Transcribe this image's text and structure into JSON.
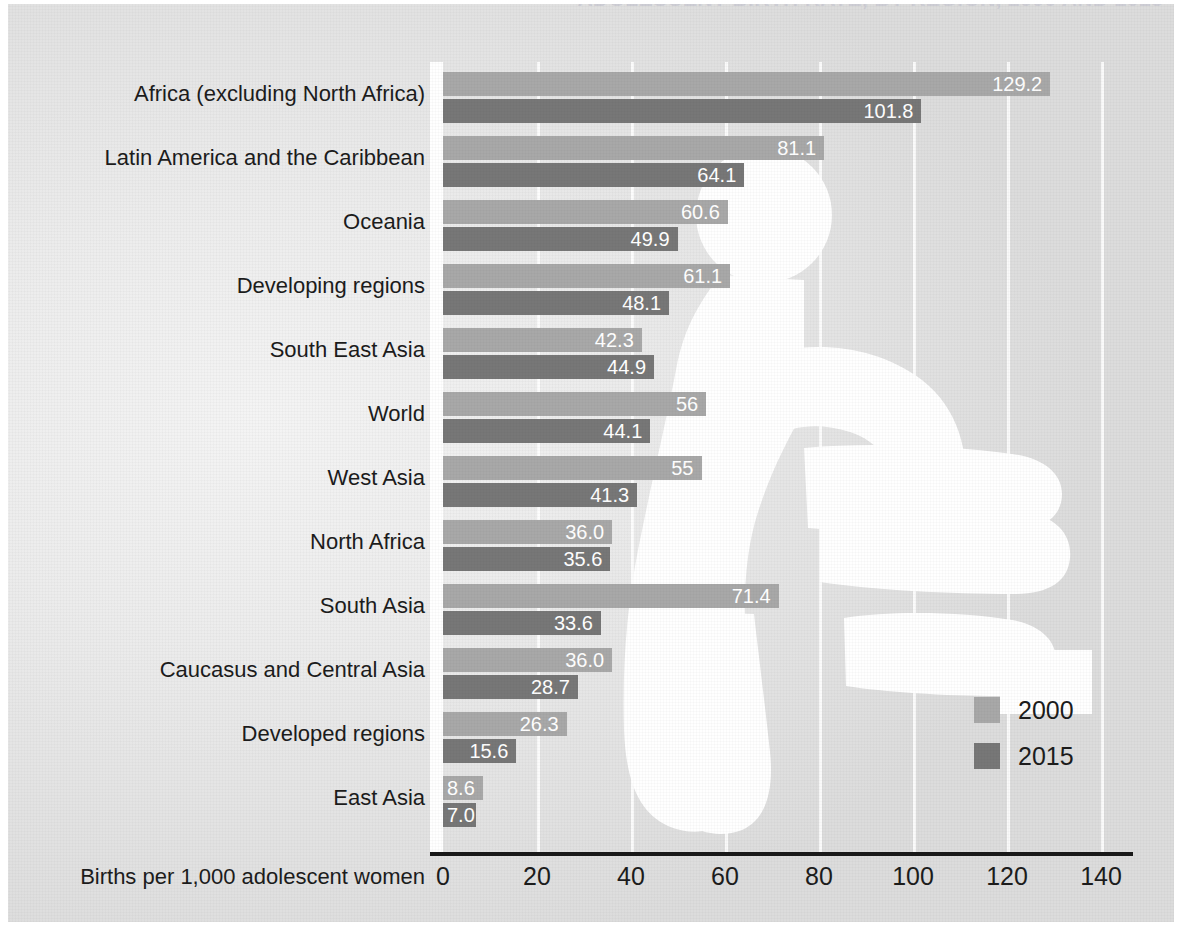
{
  "title": "ADOLESCENT BIRTH RATE, BY REGION, 2000 AND 2015",
  "legend": {
    "items": [
      {
        "label": "2000",
        "color": "#a8a8a8"
      },
      {
        "label": "2015",
        "color": "#777777"
      }
    ]
  },
  "axis": {
    "ylabel": "Births per 1,000 adolescent women",
    "xticks": [
      "0",
      "20",
      "40",
      "60",
      "80",
      "100",
      "120",
      "140"
    ]
  },
  "chart_data": {
    "type": "bar",
    "orientation": "horizontal",
    "title": "ADOLESCENT BIRTH RATE, BY REGION, 2000 AND 2015",
    "xlabel": "Births per 1,000 adolescent women",
    "ylabel": "",
    "xlim": [
      0,
      140
    ],
    "xticks": [
      0,
      20,
      40,
      60,
      80,
      100,
      120,
      140
    ],
    "grid": true,
    "legend_position": "bottom-right",
    "categories": [
      "Africa (excluding North Africa)",
      "Latin America and the Caribbean",
      "Oceania",
      "Developing regions",
      "South East Asia",
      "World",
      "West Asia",
      "North Africa",
      "South Asia",
      "Caucasus and Central Asia",
      "Developed regions",
      "East Asia"
    ],
    "series": [
      {
        "name": "2000",
        "color": "#a8a8a8",
        "values": [
          129.2,
          81.1,
          60.6,
          61.1,
          42.3,
          56,
          55,
          36.0,
          71.4,
          36.0,
          26.3,
          8.6
        ],
        "labels": [
          "129.2",
          "81.1",
          "60.6",
          "61.1",
          "42.3",
          "56",
          "55",
          "36.0",
          "71.4",
          "36.0",
          "26.3",
          "8.6"
        ]
      },
      {
        "name": "2015",
        "color": "#777777",
        "values": [
          101.8,
          64.1,
          49.9,
          48.1,
          44.9,
          44.1,
          41.3,
          35.6,
          33.6,
          28.7,
          15.6,
          7.0
        ],
        "labels": [
          "101.8",
          "64.1",
          "49.9",
          "48.1",
          "44.9",
          "44.1",
          "41.3",
          "35.6",
          "33.6",
          "28.7",
          "15.6",
          "7.0"
        ]
      }
    ]
  }
}
